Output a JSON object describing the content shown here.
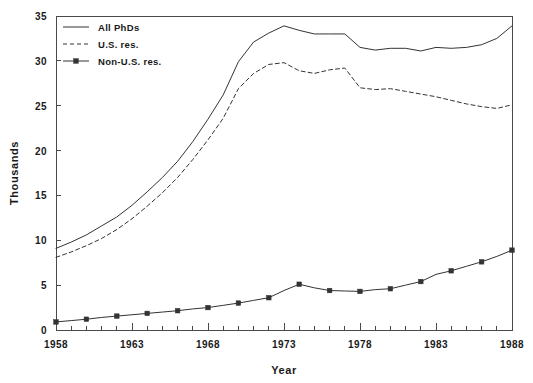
{
  "chart_data": {
    "type": "line",
    "title": "",
    "xlabel": "Year",
    "ylabel": "Thousands",
    "xlim": [
      1958,
      1988
    ],
    "ylim": [
      0,
      35
    ],
    "ytick_step": 5,
    "xtick_step": 5,
    "xminor_step": 1,
    "grid": false,
    "legend_position": "top-left",
    "x": [
      1958,
      1959,
      1960,
      1961,
      1962,
      1963,
      1964,
      1965,
      1966,
      1967,
      1968,
      1969,
      1970,
      1971,
      1972,
      1973,
      1974,
      1975,
      1976,
      1977,
      1978,
      1979,
      1980,
      1981,
      1982,
      1983,
      1984,
      1985,
      1986,
      1987,
      1988
    ],
    "xticklabels": [
      "1958",
      "1963",
      "1968",
      "1973",
      "1978",
      "1983",
      "1988"
    ],
    "yticklabels": [
      "0",
      "5",
      "10",
      "15",
      "20",
      "25",
      "30",
      "35"
    ],
    "series": [
      {
        "name": "All PhDs",
        "style": "solid",
        "marker": "none",
        "color": "#333333",
        "values": [
          9.1,
          9.8,
          10.6,
          11.6,
          12.6,
          13.9,
          15.4,
          17.0,
          18.8,
          21.0,
          23.5,
          26.2,
          29.9,
          32.1,
          33.1,
          33.9,
          33.4,
          33.0,
          33.0,
          33.0,
          31.5,
          31.2,
          31.4,
          31.4,
          31.1,
          31.5,
          31.4,
          31.5,
          31.8,
          32.5,
          33.9
        ]
      },
      {
        "name": "U.S. res.",
        "style": "dashed",
        "marker": "none",
        "color": "#333333",
        "values": [
          8.1,
          8.7,
          9.4,
          10.2,
          11.2,
          12.4,
          13.8,
          15.3,
          17.0,
          19.0,
          21.2,
          23.6,
          26.9,
          28.6,
          29.6,
          29.8,
          28.9,
          28.6,
          29.0,
          29.2,
          27.0,
          26.8,
          26.9,
          26.6,
          26.3,
          26.0,
          25.6,
          25.2,
          24.9,
          24.7,
          25.1
        ]
      },
      {
        "name": "Non-U.S. res.",
        "style": "solid",
        "marker": "square",
        "color": "#333333",
        "values": [
          0.9,
          1.05,
          1.2,
          1.4,
          1.55,
          1.7,
          1.85,
          2.0,
          2.15,
          2.35,
          2.5,
          2.75,
          3.0,
          3.3,
          3.6,
          4.4,
          5.1,
          4.7,
          4.4,
          4.35,
          4.3,
          4.5,
          4.6,
          5.0,
          5.4,
          6.2,
          6.6,
          7.1,
          7.6,
          8.2,
          8.9
        ]
      }
    ],
    "marker_x": [
      1958,
      1960,
      1962,
      1964,
      1966,
      1968,
      1970,
      1972,
      1974,
      1976,
      1978,
      1980,
      1982,
      1984,
      1986,
      1988
    ]
  },
  "legend": {
    "items": [
      {
        "label": "All PhDs"
      },
      {
        "label": "U.S. res."
      },
      {
        "label": "Non-U.S. res."
      }
    ]
  },
  "axes": {
    "ylabel": "Thousands",
    "xlabel": "Year"
  }
}
